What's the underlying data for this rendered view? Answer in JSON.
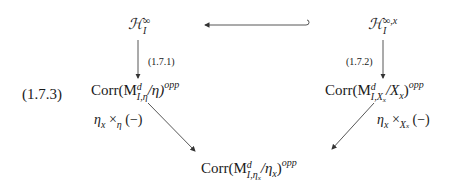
{
  "equation_number": "(1.7.3)",
  "nodes": {
    "top_left": {
      "base": "ℋ",
      "sup": "∞",
      "sub": "I"
    },
    "top_right": {
      "base": "ℋ",
      "sup": "∞,x",
      "sub": "I"
    },
    "mid_left": {
      "prefix": "Corr(M",
      "sup": "d",
      "sub": "I,η",
      "suffix": "/η)",
      "exp": "opp"
    },
    "mid_right": {
      "prefix": "Corr(M",
      "sup": "d",
      "sub": "I,X",
      "subsub": "x",
      "suffix_a": "/X",
      "suffix_a_sub": "x",
      "suffix_b": ")",
      "exp": "opp"
    },
    "bottom": {
      "prefix": "Corr(M",
      "sup": "d",
      "sub": "I,η",
      "subsub": "x",
      "suffix_a": "/η",
      "suffix_a_sub": "x",
      "suffix_b": ")",
      "exp": "opp"
    }
  },
  "arrow_labels": {
    "left_vertical": "(1.7.1)",
    "right_vertical": "(1.7.2)",
    "left_diag": {
      "a": "η",
      "a_sub": "x",
      "op": " ×",
      "op_sub": "η",
      "tail": " (−)"
    },
    "right_diag": {
      "a": "η",
      "a_sub": "x",
      "op": " ×",
      "op_sub": "X",
      "op_subsub": "x",
      "tail": " (−)"
    }
  }
}
